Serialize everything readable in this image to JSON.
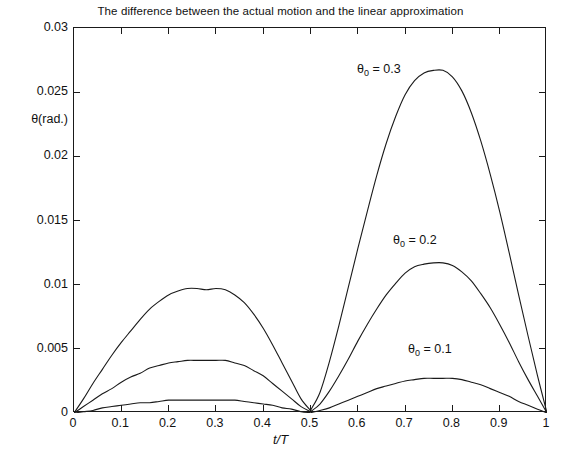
{
  "chart_data": {
    "type": "line",
    "title": "The difference between the actual motion and the linear approximation",
    "xlabel": "t/T",
    "ylabel": "θ(rad.)",
    "xlim": [
      0,
      1
    ],
    "ylim": [
      0,
      0.03
    ],
    "grid": false,
    "legend_position": "inline-annotations",
    "xticks": [
      "0",
      "0.1",
      "0.2",
      "0.3",
      "0.4",
      "0.5",
      "0.6",
      "0.7",
      "0.8",
      "0.9",
      "1"
    ],
    "xtick_values": [
      0,
      0.1,
      0.2,
      0.3,
      0.4,
      0.5,
      0.6,
      0.7,
      0.8,
      0.9,
      1
    ],
    "yticks": [
      "0",
      "0.005",
      "0.01",
      "0.015",
      "0.02",
      "0.025",
      "0.03"
    ],
    "ytick_values": [
      0,
      0.005,
      0.01,
      0.015,
      0.02,
      0.025,
      0.03
    ],
    "line_color": "#1a1a1a",
    "x": [
      0,
      0.02,
      0.04,
      0.06,
      0.08,
      0.1,
      0.12,
      0.14,
      0.16,
      0.18,
      0.2,
      0.22,
      0.24,
      0.26,
      0.28,
      0.3,
      0.32,
      0.34,
      0.36,
      0.38,
      0.4,
      0.42,
      0.44,
      0.46,
      0.48,
      0.5,
      0.52,
      0.54,
      0.56,
      0.58,
      0.6,
      0.62,
      0.64,
      0.66,
      0.68,
      0.7,
      0.72,
      0.74,
      0.76,
      0.78,
      0.8,
      0.82,
      0.84,
      0.86,
      0.88,
      0.9,
      0.92,
      0.94,
      0.96,
      0.98,
      1
    ],
    "series": [
      {
        "name": "θ₀ = 0.3",
        "label": "θ",
        "subscript": "0",
        "value_text": "= 0.3",
        "theta0": 0.3,
        "peak1": {
          "x": 0.3,
          "y": 0.0097
        },
        "peak2": {
          "x": 0.775,
          "y": 0.0267
        },
        "values": [
          0,
          0.0011,
          0.0023,
          0.0034,
          0.0045,
          0.0055,
          0.0064,
          0.0073,
          0.0081,
          0.0087,
          0.0092,
          0.0095,
          0.0097,
          0.0097,
          0.0096,
          0.0097,
          0.0096,
          0.0092,
          0.0086,
          0.0077,
          0.0066,
          0.0053,
          0.0039,
          0.0025,
          0.0011,
          0.0002,
          0.0016,
          0.004,
          0.0068,
          0.0098,
          0.0128,
          0.0157,
          0.0185,
          0.021,
          0.0231,
          0.0248,
          0.0259,
          0.0265,
          0.0267,
          0.0267,
          0.0262,
          0.0251,
          0.0234,
          0.0212,
          0.0186,
          0.0157,
          0.0125,
          0.0092,
          0.006,
          0.0029,
          0
        ]
      },
      {
        "name": "θ₀ = 0.2",
        "label": "θ",
        "subscript": "0",
        "value_text": "= 0.2",
        "theta0": 0.2,
        "peak1": {
          "x": 0.31,
          "y": 0.0041
        },
        "peak2": {
          "x": 0.78,
          "y": 0.0117
        },
        "values": [
          0,
          0.0005,
          0.001,
          0.0015,
          0.0019,
          0.0024,
          0.0028,
          0.0031,
          0.0035,
          0.0037,
          0.0039,
          0.004,
          0.0041,
          0.0041,
          0.0041,
          0.0041,
          0.0041,
          0.0039,
          0.0037,
          0.0033,
          0.0029,
          0.0023,
          0.0017,
          0.0011,
          0.0005,
          0.0001,
          0.0007,
          0.0017,
          0.0029,
          0.0042,
          0.0056,
          0.0069,
          0.0081,
          0.0092,
          0.0101,
          0.0109,
          0.0114,
          0.0116,
          0.0117,
          0.0117,
          0.0115,
          0.011,
          0.0103,
          0.0093,
          0.0082,
          0.0069,
          0.0055,
          0.004,
          0.0026,
          0.0013,
          0
        ]
      },
      {
        "name": "θ₀ = 0.1",
        "label": "θ",
        "subscript": "0",
        "value_text": "= 0.1",
        "theta0": 0.1,
        "peak1": {
          "x": 0.31,
          "y": 0.001
        },
        "peak2": {
          "x": 0.78,
          "y": 0.0027
        },
        "values": [
          0,
          0.0001,
          0.0002,
          0.0004,
          0.0005,
          0.0006,
          0.0007,
          0.0008,
          0.0008,
          0.0009,
          0.001,
          0.001,
          0.001,
          0.001,
          0.001,
          0.001,
          0.001,
          0.001,
          0.0009,
          0.0008,
          0.0007,
          0.0006,
          0.0004,
          0.0003,
          0.0001,
          3e-05,
          0.0002,
          0.0004,
          0.0007,
          0.001,
          0.0013,
          0.0016,
          0.0019,
          0.0021,
          0.0023,
          0.0025,
          0.0026,
          0.0027,
          0.0027,
          0.0027,
          0.0027,
          0.0026,
          0.0024,
          0.0022,
          0.0019,
          0.0016,
          0.0013,
          0.0009,
          0.0006,
          0.0003,
          0
        ]
      }
    ],
    "annotations": [
      {
        "text": "θ",
        "sub": "0",
        "rest": "= 0.3",
        "x_px": 357,
        "y_px": 62
      },
      {
        "text": "θ",
        "sub": "0",
        "rest": "= 0.2",
        "x_px": 393,
        "y_px": 233
      },
      {
        "text": "θ",
        "sub": "0",
        "rest": "= 0.1",
        "x_px": 408,
        "y_px": 342
      }
    ]
  }
}
